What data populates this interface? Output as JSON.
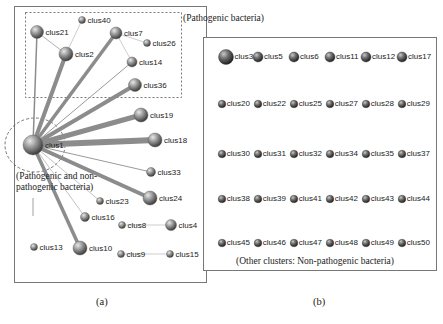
{
  "panel_a": {
    "caption": "(a)",
    "pathogenic_label": "(Pathogenic bacteria)",
    "mixed_label_line1": "(Pathogenic and non-",
    "mixed_label_line2": "pathogenic bacteria)",
    "nodes": [
      {
        "id": "clus1",
        "x": 33,
        "y": 145,
        "r": 10
      },
      {
        "id": "clus21",
        "x": 37,
        "y": 32,
        "r": 6.5
      },
      {
        "id": "clus40",
        "x": 82,
        "y": 20,
        "r": 3.5
      },
      {
        "id": "clus2",
        "x": 66,
        "y": 54,
        "r": 7
      },
      {
        "id": "clus7",
        "x": 116,
        "y": 33,
        "r": 6
      },
      {
        "id": "clus26",
        "x": 147,
        "y": 43,
        "r": 3.5
      },
      {
        "id": "clus14",
        "x": 132,
        "y": 62,
        "r": 5
      },
      {
        "id": "clus36",
        "x": 135,
        "y": 85,
        "r": 6.5
      },
      {
        "id": "clus19",
        "x": 141,
        "y": 115,
        "r": 7
      },
      {
        "id": "clus18",
        "x": 155,
        "y": 140,
        "r": 7
      },
      {
        "id": "clus33",
        "x": 151,
        "y": 172,
        "r": 4.5
      },
      {
        "id": "clus24",
        "x": 150,
        "y": 198,
        "r": 7
      },
      {
        "id": "clus23",
        "x": 100,
        "y": 201,
        "r": 3.5
      },
      {
        "id": "clus16",
        "x": 85,
        "y": 217,
        "r": 4.5
      },
      {
        "id": "clus8",
        "x": 122,
        "y": 225,
        "r": 3.5
      },
      {
        "id": "clus4",
        "x": 171,
        "y": 225,
        "r": 5.5
      },
      {
        "id": "clus13",
        "x": 34,
        "y": 247,
        "r": 3.5
      },
      {
        "id": "clus10",
        "x": 80,
        "y": 248,
        "r": 7
      },
      {
        "id": "clus9",
        "x": 121,
        "y": 254,
        "r": 3.5
      },
      {
        "id": "clus15",
        "x": 170,
        "y": 254,
        "r": 3.5
      }
    ],
    "edges": [
      {
        "from": "clus1",
        "to": "clus21",
        "w": 1.5
      },
      {
        "from": "clus1",
        "to": "clus2",
        "w": 4
      },
      {
        "from": "clus1",
        "to": "clus7",
        "w": 3.5
      },
      {
        "from": "clus1",
        "to": "clus14",
        "w": 1
      },
      {
        "from": "clus1",
        "to": "clus36",
        "w": 4
      },
      {
        "from": "clus1",
        "to": "clus19",
        "w": 5
      },
      {
        "from": "clus1",
        "to": "clus18",
        "w": 6
      },
      {
        "from": "clus1",
        "to": "clus33",
        "w": 1
      },
      {
        "from": "clus1",
        "to": "clus24",
        "w": 4
      },
      {
        "from": "clus1",
        "to": "clus23",
        "w": 0.6
      },
      {
        "from": "clus1",
        "to": "clus16",
        "w": 0.6
      },
      {
        "from": "clus1",
        "to": "clus10",
        "w": 3.5
      },
      {
        "from": "clus21",
        "to": "clus2",
        "w": 0.8
      },
      {
        "from": "clus2",
        "to": "clus40",
        "w": 0.5
      },
      {
        "from": "clus7",
        "to": "clus26",
        "w": 0.5
      },
      {
        "from": "clus7",
        "to": "clus14",
        "w": 0.5
      },
      {
        "from": "clus8",
        "to": "clus4",
        "w": 0.5
      },
      {
        "from": "clus9",
        "to": "clus15",
        "w": 0.5
      }
    ]
  },
  "panel_b": {
    "caption": "(b)",
    "bottom_label": "(Other clusters: Non-pathogenic bacteria)",
    "rows": [
      [
        "clus3",
        "clus5",
        "clus6",
        "clus11",
        "clus12",
        "clus17"
      ],
      [
        "clus20",
        "clus22",
        "clus25",
        "clus27",
        "clus28",
        "clus29"
      ],
      [
        "clus30",
        "clus31",
        "clus32",
        "clus34",
        "clus35",
        "clus37"
      ],
      [
        "clus38",
        "clus39",
        "clus41",
        "clus42",
        "clus43",
        "clus44"
      ],
      [
        "clus45",
        "clus46",
        "clus47",
        "clus48",
        "clus49",
        "clus50"
      ]
    ]
  }
}
